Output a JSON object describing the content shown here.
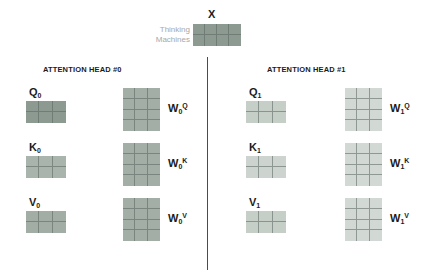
{
  "diagram": {
    "input": {
      "label": "X",
      "tokens_line1": "Thinking",
      "tokens_line2": "Machines",
      "matrix": {
        "name": "X",
        "cols": 4,
        "rows": 2,
        "color": "#8d9a92"
      }
    },
    "divider": {
      "color": "#4c4c4c"
    },
    "heads": [
      {
        "id": "head-0",
        "title": "ATTENTION HEAD #0",
        "rows": [
          {
            "out_label": "Q",
            "out_sub": "0",
            "out_matrix": {
              "cols": 3,
              "rows": 2,
              "color": "#8d9a92"
            },
            "w_label": "W",
            "w_sub": "0",
            "w_sup": "Q",
            "w_matrix": {
              "cols": 3,
              "rows": 4,
              "color": "#a3aea6"
            }
          },
          {
            "out_label": "K",
            "out_sub": "0",
            "out_matrix": {
              "cols": 3,
              "rows": 2,
              "color": "#a9b4ac"
            },
            "w_label": "W",
            "w_sub": "0",
            "w_sup": "K",
            "w_matrix": {
              "cols": 3,
              "rows": 4,
              "color": "#a3aea6"
            }
          },
          {
            "out_label": "V",
            "out_sub": "0",
            "out_matrix": {
              "cols": 3,
              "rows": 2,
              "color": "#a2ada5"
            },
            "w_label": "W",
            "w_sub": "0",
            "w_sup": "V",
            "w_matrix": {
              "cols": 3,
              "rows": 4,
              "color": "#a3aea6"
            }
          }
        ]
      },
      {
        "id": "head-1",
        "title": "ATTENTION HEAD #1",
        "rows": [
          {
            "out_label": "Q",
            "out_sub": "1",
            "out_matrix": {
              "cols": 3,
              "rows": 2,
              "color": "#c6cec8"
            },
            "w_label": "W",
            "w_sub": "1",
            "w_sup": "Q",
            "w_matrix": {
              "cols": 3,
              "rows": 4,
              "color": "#d2d8d4"
            }
          },
          {
            "out_label": "K",
            "out_sub": "1",
            "out_matrix": {
              "cols": 3,
              "rows": 2,
              "color": "#cdd4cf"
            },
            "w_label": "W",
            "w_sub": "1",
            "w_sup": "K",
            "w_matrix": {
              "cols": 3,
              "rows": 4,
              "color": "#d2d8d4"
            }
          },
          {
            "out_label": "V",
            "out_sub": "1",
            "out_matrix": {
              "cols": 3,
              "rows": 2,
              "color": "#c6cec8"
            },
            "w_label": "W",
            "w_sub": "1",
            "w_sup": "V",
            "w_matrix": {
              "cols": 3,
              "rows": 4,
              "color": "#d2d8d4"
            }
          }
        ]
      }
    ]
  }
}
